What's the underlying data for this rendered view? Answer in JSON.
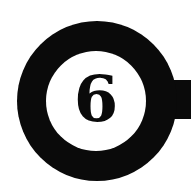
{
  "badge": {
    "number": "6",
    "colors": {
      "ring": "#0a0a0a",
      "background": "#ffffff"
    }
  }
}
